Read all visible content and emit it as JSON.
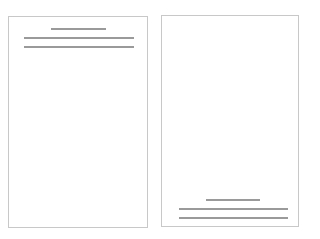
{
  "diagram": {
    "colors": {
      "border": "#c8c8c8",
      "line": "#9a9a9a",
      "background": "#ffffff"
    },
    "pages": [
      {
        "name": "page-header-layout",
        "box": {
          "left": 8,
          "top": 16,
          "width": 140,
          "height": 212
        },
        "lines": [
          {
            "kind": "title",
            "left": 51,
            "top": 28,
            "width": 55
          },
          {
            "kind": "text",
            "left": 24,
            "top": 37,
            "width": 110
          },
          {
            "kind": "text",
            "left": 24,
            "top": 46,
            "width": 110
          }
        ]
      },
      {
        "name": "page-footer-layout",
        "box": {
          "left": 161,
          "top": 15,
          "width": 138,
          "height": 212
        },
        "lines": [
          {
            "kind": "title",
            "left": 206,
            "top": 199,
            "width": 54
          },
          {
            "kind": "text",
            "left": 179,
            "top": 208,
            "width": 109
          },
          {
            "kind": "text",
            "left": 179,
            "top": 217,
            "width": 109
          }
        ]
      }
    ]
  }
}
